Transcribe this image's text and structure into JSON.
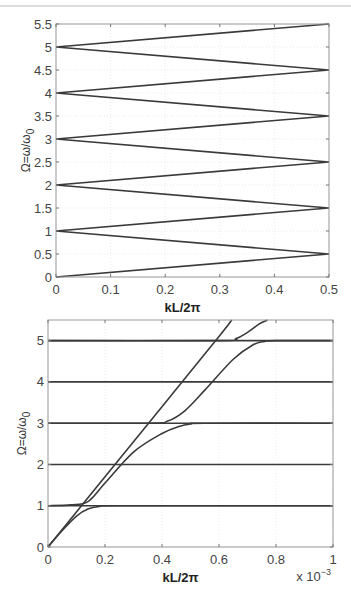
{
  "chart_data": [
    {
      "type": "line",
      "title": "",
      "xlabel": "kL/2π",
      "ylabel": "Ω=ω/ω0",
      "xlim": [
        0,
        0.5
      ],
      "ylim": [
        0,
        5.5
      ],
      "xticks": [
        "0",
        "0.1",
        "0.2",
        "0.3",
        "0.4",
        "0.5"
      ],
      "yticks": [
        "0",
        "0.5",
        "1",
        "1.5",
        "2",
        "2.5",
        "3",
        "3.5",
        "4",
        "4.5",
        "5",
        "5.5"
      ],
      "grid": true,
      "description": "Folded (zig-zag) dispersion: Ω = n ± 2·kL/2π bands",
      "series": [
        {
          "name": "band-1",
          "x": [
            0,
            0.5
          ],
          "y": [
            0,
            0.5
          ]
        },
        {
          "name": "band-2",
          "x": [
            0,
            0.5
          ],
          "y": [
            1,
            0.5
          ]
        },
        {
          "name": "band-3",
          "x": [
            0,
            0.5
          ],
          "y": [
            1,
            1.5
          ]
        },
        {
          "name": "band-4",
          "x": [
            0,
            0.5
          ],
          "y": [
            2,
            1.5
          ]
        },
        {
          "name": "band-5",
          "x": [
            0,
            0.5
          ],
          "y": [
            2,
            2.5
          ]
        },
        {
          "name": "band-6",
          "x": [
            0,
            0.5
          ],
          "y": [
            3,
            2.5
          ]
        },
        {
          "name": "band-7",
          "x": [
            0,
            0.5
          ],
          "y": [
            3,
            3.5
          ]
        },
        {
          "name": "band-8",
          "x": [
            0,
            0.5
          ],
          "y": [
            4,
            3.5
          ]
        },
        {
          "name": "band-9",
          "x": [
            0,
            0.5
          ],
          "y": [
            4,
            4.5
          ]
        },
        {
          "name": "band-10",
          "x": [
            0,
            0.5
          ],
          "y": [
            5,
            4.5
          ]
        },
        {
          "name": "band-11",
          "x": [
            0,
            0.5
          ],
          "y": [
            5,
            5.5
          ]
        }
      ]
    },
    {
      "type": "line",
      "title": "",
      "xlabel": "kL/2π",
      "ylabel": "Ω=ω/ω0",
      "xlim": [
        0,
        1
      ],
      "x_multiplier": "x 10^-3",
      "ylim": [
        0,
        5.5
      ],
      "xticks": [
        "0",
        "0.2",
        "0.4",
        "0.6",
        "0.8",
        "1"
      ],
      "yticks": [
        "0",
        "1",
        "2",
        "3",
        "4",
        "5"
      ],
      "grid": true,
      "description": "Zoomed dispersion near k=0 showing avoided crossings with flat bands at Ω=1,3,5",
      "series": [
        {
          "name": "flat-1",
          "x": [
            0,
            1
          ],
          "y": [
            1,
            1
          ]
        },
        {
          "name": "flat-2",
          "x": [
            0,
            1
          ],
          "y": [
            2,
            2
          ]
        },
        {
          "name": "flat-3",
          "x": [
            0,
            1
          ],
          "y": [
            3,
            3
          ]
        },
        {
          "name": "flat-4",
          "x": [
            0,
            1
          ],
          "y": [
            4,
            4
          ]
        },
        {
          "name": "flat-5",
          "x": [
            0,
            1
          ],
          "y": [
            5,
            5
          ]
        },
        {
          "name": "light-line",
          "x": [
            0,
            0.2,
            0.4,
            0.6,
            0.645
          ],
          "y": [
            0,
            1.7,
            3.4,
            5.1,
            5.5
          ]
        },
        {
          "name": "branch-0-1",
          "x": [
            0,
            0.05,
            0.1,
            0.14,
            0.18,
            0.25,
            1
          ],
          "y": [
            0,
            0.4,
            0.75,
            0.92,
            0.98,
            1,
            1
          ]
        },
        {
          "name": "branch-1-3",
          "x": [
            0,
            0.08,
            0.14,
            0.2,
            0.3,
            0.4,
            0.46,
            0.5,
            0.55,
            1
          ],
          "y": [
            1,
            1.02,
            1.1,
            1.55,
            2.3,
            2.75,
            2.92,
            2.98,
            3,
            3
          ]
        },
        {
          "name": "branch-3-5",
          "x": [
            0,
            0.36,
            0.42,
            0.48,
            0.55,
            0.65,
            0.72,
            0.76,
            0.8,
            1
          ],
          "y": [
            3,
            3,
            3.05,
            3.3,
            3.8,
            4.55,
            4.9,
            4.98,
            5,
            5
          ]
        },
        {
          "name": "branch-5-up",
          "x": [
            0,
            0.6,
            0.66,
            0.7,
            0.74,
            0.77
          ],
          "y": [
            5,
            5,
            5.05,
            5.2,
            5.4,
            5.5
          ]
        }
      ]
    }
  ]
}
